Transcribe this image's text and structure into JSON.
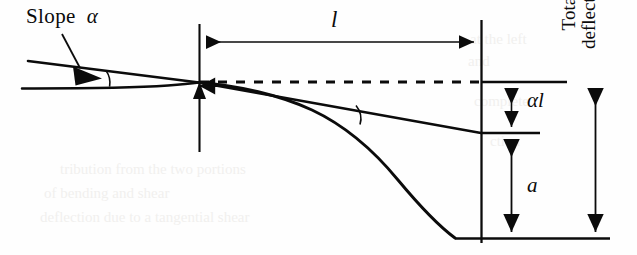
{
  "figure": {
    "kind": "beam-deflection-diagram",
    "width": 637,
    "height": 255,
    "background_color": "#fefefe",
    "ink_color": "#0b0b0b"
  },
  "labels": {
    "slope_text": "Slope",
    "slope_symbol": "α",
    "length_symbol": "l",
    "alpha_l": "αl",
    "deflection_a": "a",
    "total_deflection_line1": "Total",
    "total_deflection_line2": "deflection"
  },
  "geometry": {
    "left_station_x": 199,
    "right_station_x": 481,
    "origin_y": 82,
    "tangent_end_y": 133,
    "beam_tip_y": 238,
    "dimension_line_l_y": 42,
    "dashed_reference_y": 82,
    "alpha_l_arrow_x": 511,
    "a_arrow_x": 511,
    "total_deflection_arrow_x": 595,
    "angle_arc_x": 355,
    "angle_arc_y": 115
  },
  "ghost_text": [
    {
      "text": "at the  left",
      "x": 470,
      "y": 38,
      "size": 15
    },
    {
      "text": "and",
      "x": 468,
      "y": 60,
      "size": 15
    },
    {
      "text": "complete",
      "x": 474,
      "y": 100,
      "size": 15
    },
    {
      "text": "ction",
      "x": 490,
      "y": 140,
      "size": 15
    },
    {
      "text": "tribution  from  the  two  portions",
      "x": 60,
      "y": 168,
      "size": 15
    },
    {
      "text": "of  bending  and  shear",
      "x": 44,
      "y": 192,
      "size": 15
    },
    {
      "text": "deflection due to a  tangential  shear",
      "x": 40,
      "y": 216,
      "size": 15
    }
  ]
}
